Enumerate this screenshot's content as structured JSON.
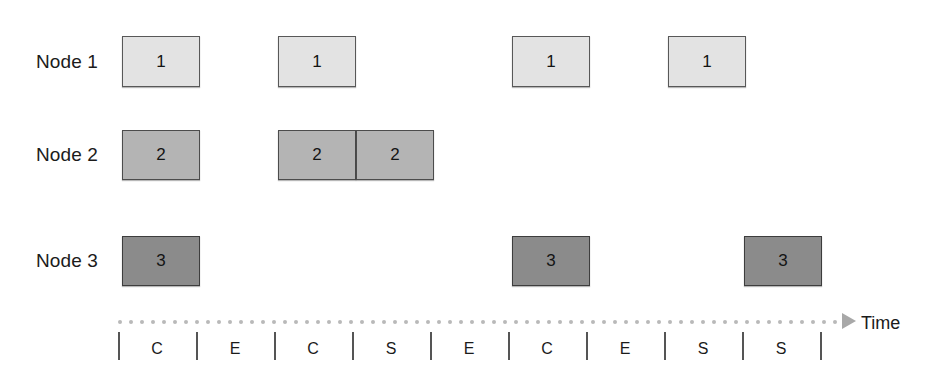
{
  "diagram": {
    "type": "gantt-schedule-timeline",
    "rows": [
      {
        "label": "Node 1",
        "box_label": "1",
        "fill": "#e3e3e3",
        "top": 36,
        "height": 51,
        "boxes": [
          {
            "x": 122,
            "width": 78
          },
          {
            "x": 278,
            "width": 78
          },
          {
            "x": 512,
            "width": 78
          },
          {
            "x": 668,
            "width": 78
          }
        ]
      },
      {
        "label": "Node 2",
        "box_label": "2",
        "fill": "#b4b4b4",
        "top": 130,
        "height": 50,
        "boxes": [
          {
            "x": 122,
            "width": 78
          },
          {
            "x": 278,
            "width": 78
          },
          {
            "x": 356,
            "width": 78
          }
        ]
      },
      {
        "label": "Node 3",
        "box_label": "3",
        "fill": "#8b8b8b",
        "top": 236,
        "height": 50,
        "boxes": [
          {
            "x": 122,
            "width": 78
          },
          {
            "x": 512,
            "width": 78
          },
          {
            "x": 744,
            "width": 78
          }
        ]
      }
    ],
    "axis": {
      "label": "Time",
      "arrow_icon": "triangle-right-icon",
      "dotted_line_color": "#b9b9b9",
      "dot_start_x": 118,
      "dot_end_x": 840,
      "dot_spacing": 11,
      "dot_y": 320,
      "tick_y": 332,
      "tick_height": 28,
      "tick_positions": [
        118,
        196,
        274,
        352,
        430,
        508,
        586,
        664,
        742,
        820
      ],
      "slot_labels": [
        "C",
        "E",
        "C",
        "S",
        "E",
        "C",
        "E",
        "S",
        "S"
      ],
      "slot_label_y": 340,
      "arrow_x": 842,
      "arrow_y": 313,
      "label_x": 861,
      "label_y": 313
    }
  }
}
